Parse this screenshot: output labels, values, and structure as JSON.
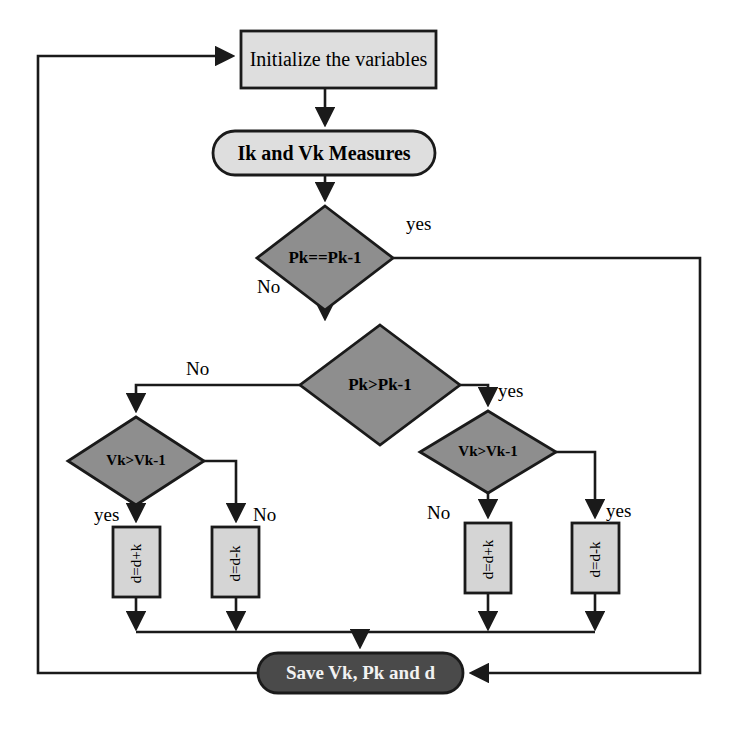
{
  "diagram": {
    "colors": {
      "process_fill": "#d5d5d5",
      "start_fill": "#dedede",
      "decision_fill": "#8e8e8e",
      "terminal_fill": "#4a4a4a",
      "stroke": "#1a1a1a",
      "text": "#000000",
      "terminal_text": "#f2f2f2",
      "background": "#ffffff"
    },
    "nodes": [
      {
        "id": "init",
        "type": "process",
        "label": "Initialize the variables",
        "x": 241,
        "y": 31,
        "w": 195,
        "h": 57
      },
      {
        "id": "measure",
        "type": "start",
        "label": "Ik and Vk Measures",
        "x": 213,
        "y": 131,
        "w": 222,
        "h": 44
      },
      {
        "id": "dec_pk_eq",
        "type": "decision",
        "label": "Pk==Pk-1",
        "cx": 325,
        "cy": 258,
        "rx": 68,
        "ry": 52
      },
      {
        "id": "dec_pk_gt",
        "type": "decision",
        "label": "Pk>Pk-1",
        "cx": 380,
        "cy": 385,
        "rx": 80,
        "ry": 60
      },
      {
        "id": "dec_vk_left",
        "type": "decision",
        "label": "Vk>Vk-1",
        "cx": 136,
        "cy": 461,
        "rx": 68,
        "ry": 44
      },
      {
        "id": "dec_vk_right",
        "type": "decision",
        "label": "Vk>Vk-1",
        "cx": 488,
        "cy": 452,
        "rx": 68,
        "ry": 41
      },
      {
        "id": "box_l1",
        "type": "process",
        "label": "d=d+k",
        "rotated": true,
        "x": 113,
        "y": 527,
        "w": 47,
        "h": 70
      },
      {
        "id": "box_l2",
        "type": "process",
        "label": "d=d-k",
        "rotated": true,
        "x": 212,
        "y": 527,
        "w": 47,
        "h": 70
      },
      {
        "id": "box_r1",
        "type": "process",
        "label": "d=d+k",
        "rotated": true,
        "x": 465,
        "y": 523,
        "w": 46,
        "h": 70
      },
      {
        "id": "box_r2",
        "type": "process",
        "label": "d=d-k",
        "rotated": true,
        "x": 572,
        "y": 523,
        "w": 47,
        "h": 70
      },
      {
        "id": "save",
        "type": "terminal",
        "label": "Save Vk, Pk and d",
        "x": 258,
        "y": 653,
        "w": 205,
        "h": 40
      }
    ],
    "edge_labels": [
      {
        "id": "pk_eq_yes",
        "text": "yes",
        "x": 406,
        "y": 213
      },
      {
        "id": "pk_eq_no",
        "text": "No",
        "x": 257,
        "y": 276
      },
      {
        "id": "pk_gt_no",
        "text": "No",
        "x": 186,
        "y": 358
      },
      {
        "id": "pk_gt_yes",
        "text": "yes",
        "x": 498,
        "y": 380
      },
      {
        "id": "vk_left_yes",
        "text": "yes",
        "x": 94,
        "y": 504
      },
      {
        "id": "vk_left_no",
        "text": "No",
        "x": 253,
        "y": 504
      },
      {
        "id": "vk_right_no",
        "text": "No",
        "x": 427,
        "y": 502
      },
      {
        "id": "vk_right_yes",
        "text": "yes",
        "x": 606,
        "y": 500
      }
    ]
  }
}
